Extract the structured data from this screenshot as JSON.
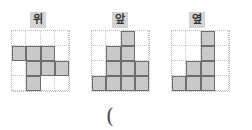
{
  "views": [
    {
      "label": "위",
      "name": "top-view",
      "cells": [
        [
          0,
          0,
          0,
          0
        ],
        [
          1,
          1,
          1,
          0
        ],
        [
          0,
          1,
          1,
          1
        ],
        [
          0,
          1,
          0,
          0
        ]
      ]
    },
    {
      "label": "앞",
      "name": "front-view",
      "cells": [
        [
          0,
          0,
          1,
          0
        ],
        [
          0,
          1,
          1,
          0
        ],
        [
          0,
          1,
          1,
          1
        ],
        [
          1,
          1,
          1,
          1
        ]
      ]
    },
    {
      "label": "옆",
      "name": "side-view",
      "cells": [
        [
          0,
          0,
          1,
          0
        ],
        [
          0,
          0,
          1,
          0
        ],
        [
          0,
          1,
          1,
          0
        ],
        [
          1,
          1,
          1,
          0
        ]
      ]
    }
  ],
  "answer": {
    "open_paren": "("
  },
  "colors": {
    "filled": "#c9c9c9",
    "label_bg": "#d4d4d4",
    "grid_line": "#b8b8b8"
  }
}
